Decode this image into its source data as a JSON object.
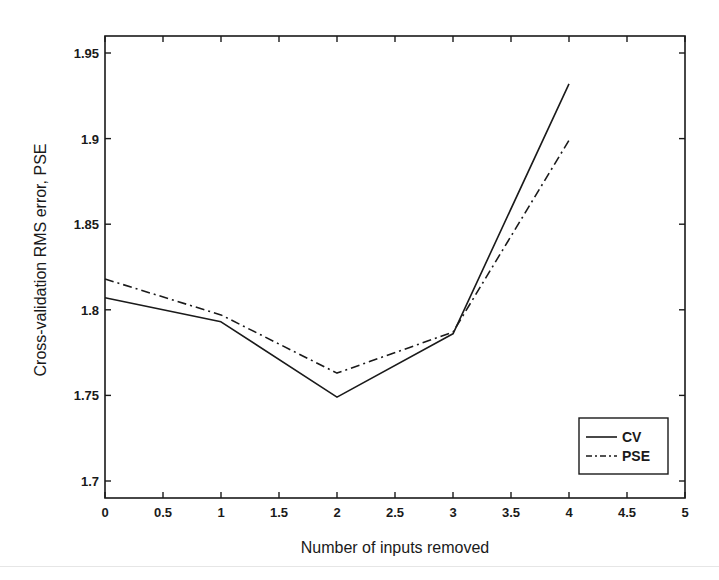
{
  "chart_data": {
    "type": "line",
    "title": "",
    "xlabel": "Number of inputs removed",
    "ylabel": "Cross-validation RMS error, PSE",
    "xlim": [
      0,
      5
    ],
    "ylim": [
      1.69,
      1.96
    ],
    "x_ticks": [
      "0",
      "0.5",
      "1",
      "1.5",
      "2",
      "2.5",
      "3",
      "3.5",
      "4",
      "4.5",
      "5"
    ],
    "y_ticks": [
      "1.7",
      "1.75",
      "1.8",
      "1.85",
      "1.9",
      "1.95"
    ],
    "grid": false,
    "legend_position": "lower right",
    "x": [
      0,
      1,
      2,
      3,
      4
    ],
    "series": [
      {
        "name": "CV",
        "style": "solid",
        "values": [
          1.807,
          1.793,
          1.749,
          1.786,
          1.932
        ]
      },
      {
        "name": "PSE",
        "style": "dash-dot",
        "values": [
          1.818,
          1.797,
          1.763,
          1.787,
          1.899
        ]
      }
    ]
  },
  "colors": {
    "line": "#1a1a1a",
    "background": "#ffffff"
  }
}
